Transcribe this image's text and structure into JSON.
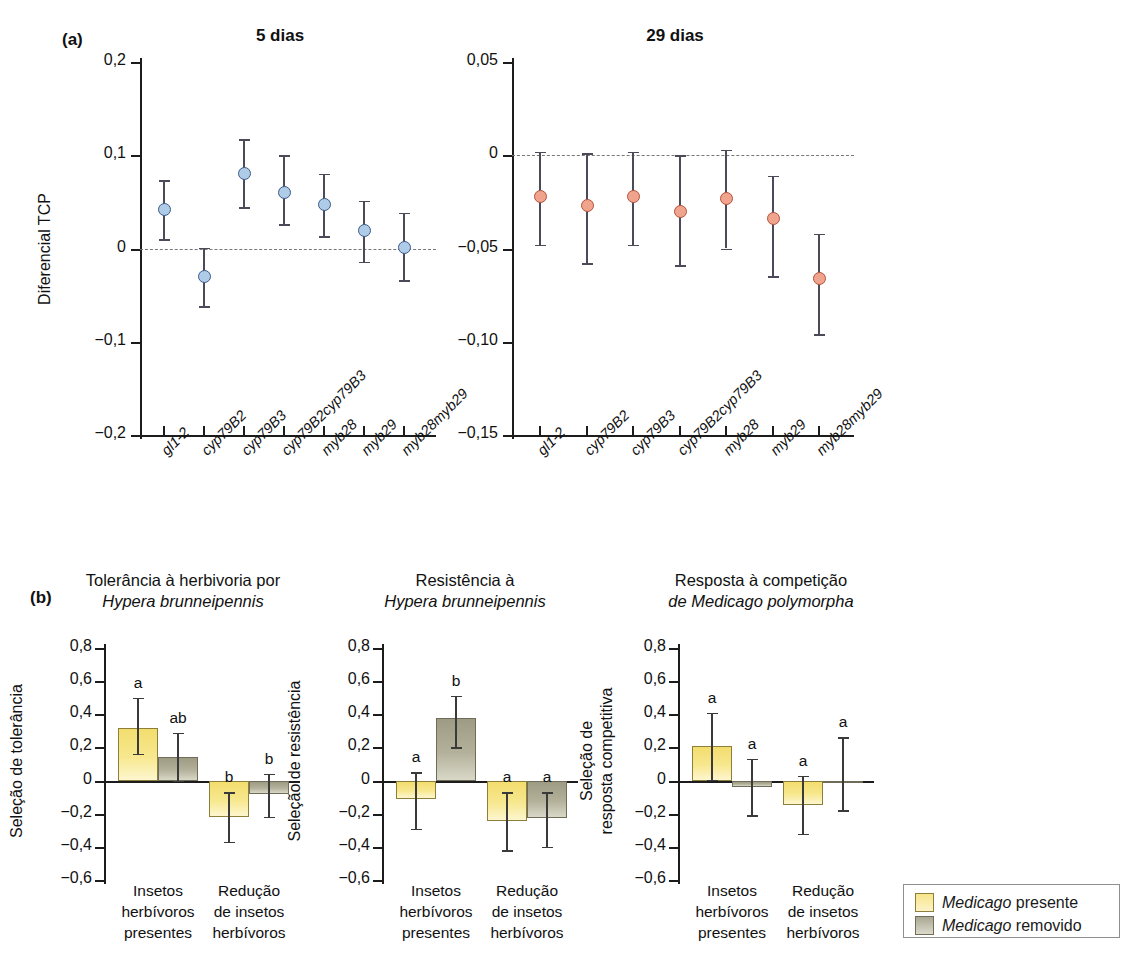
{
  "figure": {
    "panel_a_letter": "(a)",
    "panel_b_letter": "(b)"
  },
  "panel_a": {
    "left": {
      "title": "5 dias",
      "ylabel": "Diferencial TCP",
      "yticks": [
        "0,2",
        "0,1",
        "0",
        "-0,1",
        "-0,2"
      ]
    },
    "right": {
      "title": "29 dias",
      "ylabel": "",
      "yticks": [
        "0,05",
        "0",
        "-0,05",
        "-0,10",
        "-0,15"
      ]
    },
    "xticks": [
      "gl1-2",
      "cyp79B2",
      "cyp79B3",
      "cyp79B2cyp79B3",
      "myb28",
      "myb29",
      "myb28myb29"
    ]
  },
  "panel_b": {
    "charts": [
      {
        "title_line1": "Tolerância à herbivoria por",
        "title_line2_italic": "Hypera brunneipennis",
        "ylabel_line1": "Seleção de tolerância",
        "ylabel_line2": "",
        "yticks": [
          "0,8",
          "0,6",
          "0,4",
          "0,2",
          "0",
          "-0,2",
          "-0,4",
          "-0,6"
        ]
      },
      {
        "title_line1": "Resistência à",
        "title_line2_italic": "Hypera brunneipennis",
        "ylabel_line1": "Seleção de resistência",
        "ylabel_line2": "",
        "yticks": [
          "0,8",
          "0,6",
          "0,4",
          "0,2",
          "0",
          "-0,2",
          "-0,4",
          "-0,6"
        ]
      },
      {
        "title_line1": "Resposta à competição",
        "title_line2_italic": "de Medicago polymorpha",
        "ylabel_line1": "Seleção de",
        "ylabel_line2": "resposta competitiva",
        "yticks": [
          "0,8",
          "0,6",
          "0,4",
          "0,2",
          "0",
          "-0,2",
          "-0,4",
          "-0,6"
        ]
      }
    ],
    "group_labels": [
      [
        "Insetos",
        "herbívoros",
        "presentes"
      ],
      [
        "Redução",
        "de insetos",
        "herbívoros"
      ]
    ]
  },
  "legend": {
    "items": [
      {
        "label_italic": "Medicago",
        "label_rest": " presente",
        "color": "#f7e48b",
        "key": "medicago-presente"
      },
      {
        "label_italic": "Medicago",
        "label_rest": " removido",
        "color": "#a9a791",
        "key": "medicago-removido"
      }
    ]
  },
  "chart_data": [
    {
      "id": "panel-a-5-dias",
      "type": "scatter",
      "title": "5 dias",
      "xlabel": "",
      "ylabel": "Diferencial TCP",
      "ylim": [
        -0.2,
        0.2
      ],
      "yticks": [
        0.2,
        0.1,
        0,
        -0.1,
        -0.2
      ],
      "ytick_labels": [
        "0,2",
        "0,1",
        "0",
        "-0,1",
        "-0,2"
      ],
      "grid": false,
      "reference_line": 0,
      "marker_color": "#aecbe8",
      "marker_edge_color": "#3d5a86",
      "categories": [
        "gl1-2",
        "cyp79B2",
        "cyp79B3",
        "cyp79B2cyp79B3",
        "myb28",
        "myb29",
        "myb28myb29"
      ],
      "values": [
        0.042,
        -0.03,
        0.08,
        0.06,
        0.047,
        0.019,
        0.001
      ],
      "err_low": [
        0.01,
        -0.062,
        0.044,
        0.026,
        0.013,
        -0.014,
        -0.034
      ],
      "err_high": [
        0.073,
        0.001,
        0.117,
        0.1,
        0.08,
        0.051,
        0.038
      ]
    },
    {
      "id": "panel-a-29-dias",
      "type": "scatter",
      "title": "29 dias",
      "xlabel": "",
      "ylabel": "",
      "ylim": [
        -0.15,
        0.05
      ],
      "yticks": [
        0.05,
        0,
        -0.05,
        -0.1,
        -0.15
      ],
      "ytick_labels": [
        "0,05",
        "0",
        "-0,05",
        "-0,10",
        "-0,15"
      ],
      "grid": false,
      "reference_line": 0,
      "marker_color": "#f0a48e",
      "marker_edge_color": "#b4513a",
      "categories": [
        "gl1-2",
        "cyp79B2",
        "cyp79B3",
        "cyp79B2cyp79B3",
        "myb28",
        "myb29",
        "myb28myb29"
      ],
      "values": [
        -0.022,
        -0.027,
        -0.022,
        -0.03,
        -0.023,
        -0.034,
        -0.066
      ],
      "err_low": [
        -0.048,
        -0.058,
        -0.048,
        -0.059,
        -0.05,
        -0.065,
        -0.096
      ],
      "err_high": [
        0.002,
        0.001,
        0.002,
        0.0,
        0.003,
        -0.011,
        -0.042
      ]
    },
    {
      "id": "panel-b-tolerancia",
      "type": "bar",
      "title": "Tolerância à herbivoria por Hypera brunneipennis",
      "ylabel": "Seleção de tolerância",
      "ylim": [
        -0.6,
        0.8
      ],
      "yticks": [
        0.8,
        0.6,
        0.4,
        0.2,
        0,
        -0.2,
        -0.4,
        -0.6
      ],
      "ytick_labels": [
        "0,8",
        "0,6",
        "0,4",
        "0,2",
        "0",
        "-0,2",
        "-0,4",
        "-0,6"
      ],
      "categories": [
        "Insetos herbívoros presentes",
        "Redução de insetos herbívoros"
      ],
      "series": [
        {
          "name": "Medicago presente",
          "color": "#f7e48b",
          "values": [
            0.32,
            -0.22
          ],
          "err_low": [
            0.16,
            -0.37
          ],
          "err_high": [
            0.5,
            -0.07
          ],
          "sig_letters": [
            "a",
            "b"
          ]
        },
        {
          "name": "Medicago removido",
          "color": "#a9a791",
          "values": [
            0.145,
            -0.08
          ],
          "err_low": [
            0.0,
            -0.22
          ],
          "err_high": [
            0.29,
            0.04
          ],
          "sig_letters": [
            "ab",
            "b"
          ]
        }
      ]
    },
    {
      "id": "panel-b-resistencia",
      "type": "bar",
      "title": "Resistência à Hypera brunneipennis",
      "ylabel": "Seleção de resistência",
      "ylim": [
        -0.6,
        0.8
      ],
      "yticks": [
        0.8,
        0.6,
        0.4,
        0.2,
        0,
        -0.2,
        -0.4,
        -0.6
      ],
      "ytick_labels": [
        "0,8",
        "0,6",
        "0,4",
        "0,2",
        "0",
        "-0,2",
        "-0,4",
        "-0,6"
      ],
      "categories": [
        "Insetos herbívoros presentes",
        "Redução de insetos herbívoros"
      ],
      "series": [
        {
          "name": "Medicago presente",
          "color": "#f7e48b",
          "values": [
            -0.11,
            -0.245
          ],
          "err_low": [
            -0.29,
            -0.42
          ],
          "err_high": [
            0.05,
            -0.07
          ],
          "sig_letters": [
            "a",
            "a"
          ]
        },
        {
          "name": "Medicago removido",
          "color": "#a9a791",
          "values": [
            0.375,
            -0.225
          ],
          "err_low": [
            0.2,
            -0.4
          ],
          "err_high": [
            0.51,
            -0.07
          ],
          "sig_letters": [
            "b",
            "a"
          ]
        }
      ]
    },
    {
      "id": "panel-b-competicao",
      "type": "bar",
      "title": "Resposta à competição de Medicago polymorpha",
      "ylabel": "Seleção de resposta competitiva",
      "ylim": [
        -0.6,
        0.8
      ],
      "yticks": [
        0.8,
        0.6,
        0.4,
        0.2,
        0,
        -0.2,
        -0.4,
        -0.6
      ],
      "ytick_labels": [
        "0,8",
        "0,6",
        "0,4",
        "0,2",
        "0",
        "-0,2",
        "-0,4",
        "-0,6"
      ],
      "categories": [
        "Insetos herbívoros presentes",
        "Redução de insetos herbívoros"
      ],
      "series": [
        {
          "name": "Medicago presente",
          "color": "#f7e48b",
          "values": [
            0.21,
            -0.145
          ],
          "err_low": [
            0.005,
            -0.32
          ],
          "err_high": [
            0.41,
            0.03
          ],
          "sig_letters": [
            "a",
            "a"
          ]
        },
        {
          "name": "Medicago removido",
          "color": "#a9a791",
          "values": [
            -0.04,
            0.0
          ],
          "err_low": [
            -0.21,
            -0.18
          ],
          "err_high": [
            0.13,
            0.26
          ],
          "sig_letters": [
            "a",
            "a"
          ]
        }
      ]
    }
  ]
}
